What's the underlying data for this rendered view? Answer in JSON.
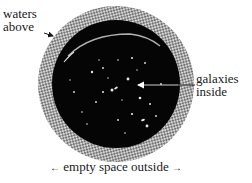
{
  "diagram": {
    "type": "labeled-illustration",
    "labels": {
      "waters_above_line1": "waters",
      "waters_above_line2": "above",
      "galaxies_inside_line1": "galaxies",
      "galaxies_inside_line2": "inside",
      "empty_space_outside": "empty space outside"
    },
    "arrows": {
      "left_arrow_glyph": "←",
      "right_arrow_glyph": "→"
    },
    "colors": {
      "interior": "#050505",
      "shell_light": "#d8d8d8",
      "shell_dark": "#6a6a6a",
      "text": "#1a1a1a",
      "background": "#ffffff",
      "galaxy_specks": "#e8e8e8"
    }
  }
}
